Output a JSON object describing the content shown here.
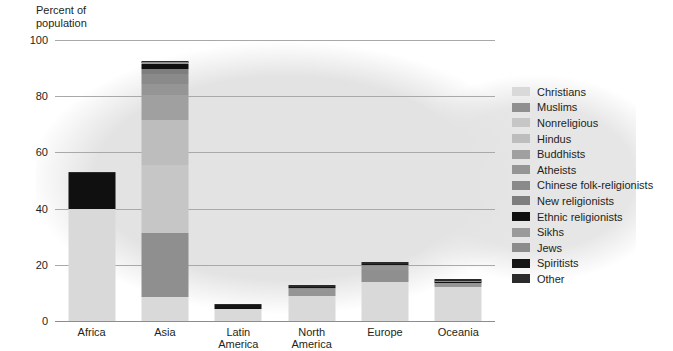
{
  "axis": {
    "ylabel": "Percent of\npopulation",
    "yticks": [
      100,
      80,
      60,
      40,
      20,
      0
    ],
    "ylim": [
      0,
      100
    ]
  },
  "chart_data": {
    "type": "bar",
    "title": "",
    "subtitle": "",
    "xlabel": "",
    "ylabel": "Percent of population",
    "ylim": [
      0,
      100
    ],
    "grid": true,
    "stacked": true,
    "legend_position": "right",
    "categories": [
      "Africa",
      "Asia",
      "Latin\nAmerica",
      "North\nAmerica",
      "Europe",
      "Oceania"
    ],
    "tick_labels": [
      "100",
      "80",
      "60",
      "40",
      "20",
      "0"
    ],
    "series": [
      {
        "name": "Christians",
        "color": "#d9d9d9",
        "values": [
          40.0,
          8.5,
          4.2,
          9.0,
          14.0,
          12.0
        ]
      },
      {
        "name": "Muslims",
        "color": "#8f8f8f",
        "values": [
          0.0,
          23.0,
          0.0,
          0.0,
          4.0,
          0.0
        ]
      },
      {
        "name": "Nonreligious",
        "color": "#c6c6c6",
        "values": [
          0.0,
          24.0,
          0.0,
          0.0,
          0.0,
          0.0
        ]
      },
      {
        "name": "Hindus",
        "color": "#bdbdbd",
        "values": [
          0.0,
          16.0,
          0.0,
          0.0,
          0.0,
          0.0
        ]
      },
      {
        "name": "Buddhists",
        "color": "#a0a0a0",
        "values": [
          0.0,
          9.0,
          0.0,
          0.0,
          0.0,
          0.0
        ]
      },
      {
        "name": "Atheists",
        "color": "#959595",
        "values": [
          0.0,
          4.0,
          0.0,
          2.5,
          1.6,
          1.4
        ]
      },
      {
        "name": "Chinese folk-religionists",
        "color": "#8a8a8a",
        "values": [
          0.0,
          3.5,
          0.0,
          0.0,
          0.0,
          0.0
        ]
      },
      {
        "name": "New religionists",
        "color": "#7e7e7e",
        "values": [
          0.0,
          1.6,
          0.0,
          0.0,
          0.0,
          0.0
        ]
      },
      {
        "name": "Ethnic religionists",
        "color": "#101010",
        "values": [
          12.8,
          1.8,
          0.5,
          0.0,
          0.0,
          0.5
        ]
      },
      {
        "name": "Sikhs",
        "color": "#9a9a9a",
        "values": [
          0.0,
          0.5,
          0.0,
          0.0,
          0.0,
          0.0
        ]
      },
      {
        "name": "Jews",
        "color": "#8c8c8c",
        "values": [
          0.0,
          0.2,
          0.0,
          0.4,
          0.5,
          0.2
        ]
      },
      {
        "name": "Spiritists",
        "color": "#151515",
        "values": [
          0.0,
          0.1,
          0.9,
          0.3,
          0.2,
          0.1
        ]
      },
      {
        "name": "Other",
        "color": "#2b2b2b",
        "values": [
          0.2,
          0.3,
          0.4,
          0.8,
          0.7,
          0.8
        ]
      }
    ],
    "totals": [
      53.0,
      92.5,
      6.0,
      13.0,
      21.0,
      15.0
    ]
  }
}
